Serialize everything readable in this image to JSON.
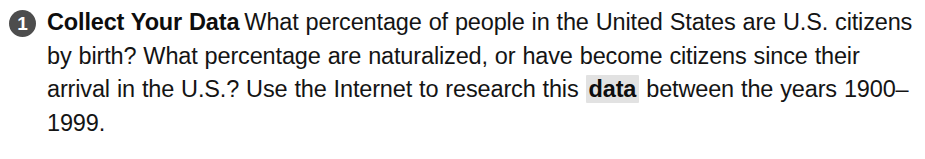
{
  "step": {
    "number": "1",
    "badge_color": "#4d4d4d",
    "badge_text_color": "#ffffff",
    "heading": "Collect Your Data",
    "body_part_1": "What percentage of people in the United States are U.S. citizens by birth? What percentage are naturalized, or have become citizens since their arrival in the U.S.? Use the Internet to research this",
    "highlighted_term": "data",
    "highlight_color": "#e2e2e2",
    "body_part_2": "between the years 1900–1999.",
    "text_color": "#141414"
  }
}
